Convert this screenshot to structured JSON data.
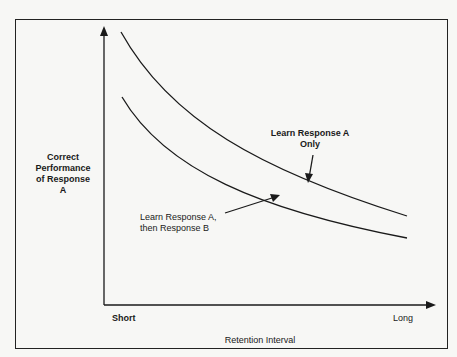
{
  "diagram": {
    "y_axis_label": [
      "Correct",
      "Performance",
      "of Response",
      "A"
    ],
    "x_axis_label": "Retention Interval",
    "x_ticks": {
      "start": "Short",
      "end": "Long"
    },
    "curves": [
      {
        "label_lines": [
          "Learn Response A",
          "Only"
        ],
        "position": "upper"
      },
      {
        "label_lines": [
          "Learn Response A,",
          "then Response B"
        ],
        "position": "lower"
      }
    ]
  }
}
